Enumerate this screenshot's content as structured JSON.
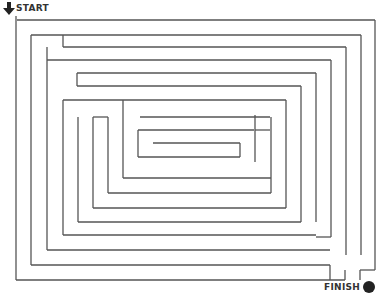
{
  "puzzle": {
    "type": "maze",
    "start_label": "START",
    "finish_label": "FINISH",
    "line_color": "#555555",
    "marker_color": "#222222"
  },
  "walls": [
    [
      16,
      16,
      16,
      280
    ],
    [
      16,
      280,
      345,
      280
    ],
    [
      345,
      280,
      345,
      270
    ],
    [
      16,
      16,
      16,
      16
    ],
    [
      17,
      20,
      375,
      20
    ],
    [
      375,
      20,
      375,
      270
    ],
    [
      360,
      270,
      375,
      270
    ],
    [
      360,
      270,
      360,
      280
    ],
    [
      31,
      35,
      361,
      35
    ],
    [
      361,
      35,
      361,
      255
    ],
    [
      31,
      35,
      31,
      265
    ],
    [
      31,
      265,
      330,
      265
    ],
    [
      330,
      265,
      330,
      280
    ],
    [
      63,
      35,
      63,
      47
    ],
    [
      63,
      47,
      346,
      47
    ],
    [
      346,
      47,
      346,
      255
    ],
    [
      47,
      47,
      47,
      250
    ],
    [
      47,
      250,
      330,
      250
    ],
    [
      47,
      60,
      331,
      60
    ],
    [
      331,
      60,
      331,
      237
    ],
    [
      316,
      237,
      331,
      237
    ],
    [
      77,
      73,
      316,
      73
    ],
    [
      316,
      73,
      316,
      222
    ],
    [
      77,
      73,
      77,
      86
    ],
    [
      77,
      86,
      301,
      86
    ],
    [
      301,
      86,
      301,
      222
    ],
    [
      63,
      100,
      286,
      100
    ],
    [
      286,
      100,
      286,
      208
    ],
    [
      63,
      100,
      63,
      235
    ],
    [
      63,
      235,
      316,
      235
    ],
    [
      78,
      117,
      78,
      222
    ],
    [
      78,
      222,
      301,
      222
    ],
    [
      93,
      117,
      108,
      117
    ],
    [
      93,
      117,
      93,
      208
    ],
    [
      93,
      208,
      286,
      208
    ],
    [
      108,
      117,
      108,
      193
    ],
    [
      108,
      193,
      271,
      193
    ],
    [
      123,
      100,
      123,
      178
    ],
    [
      123,
      178,
      271,
      178
    ],
    [
      140,
      117,
      270,
      117
    ],
    [
      271,
      117,
      271,
      193
    ],
    [
      138,
      130,
      254,
      130
    ],
    [
      255,
      115,
      255,
      162
    ],
    [
      255,
      130,
      270,
      130
    ],
    [
      138,
      130,
      138,
      157
    ],
    [
      138,
      157,
      240,
      157
    ],
    [
      153,
      143,
      240,
      143
    ],
    [
      240,
      143,
      240,
      157
    ],
    [
      62,
      100,
      62,
      100
    ],
    [
      78,
      208,
      78,
      208
    ],
    [
      31,
      79,
      31,
      79
    ]
  ]
}
